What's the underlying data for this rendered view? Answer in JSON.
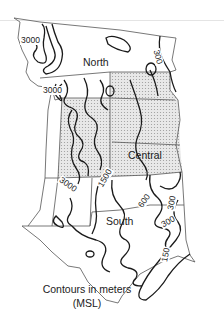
{
  "map": {
    "regions": [
      {
        "name": "North",
        "shaded": false
      },
      {
        "name": "Central",
        "shaded": true
      },
      {
        "name": "South",
        "shaded": false
      }
    ],
    "contour_labels": [
      "3000",
      "3000",
      "300",
      "3000",
      "1500",
      "600",
      "300",
      "300",
      "150"
    ],
    "legend": {
      "line1": "Contours in meters",
      "line2": "(MSL)"
    },
    "colors": {
      "stroke": "#1a1a1a",
      "border": "#555555",
      "shade": "#dcdcdc"
    }
  }
}
